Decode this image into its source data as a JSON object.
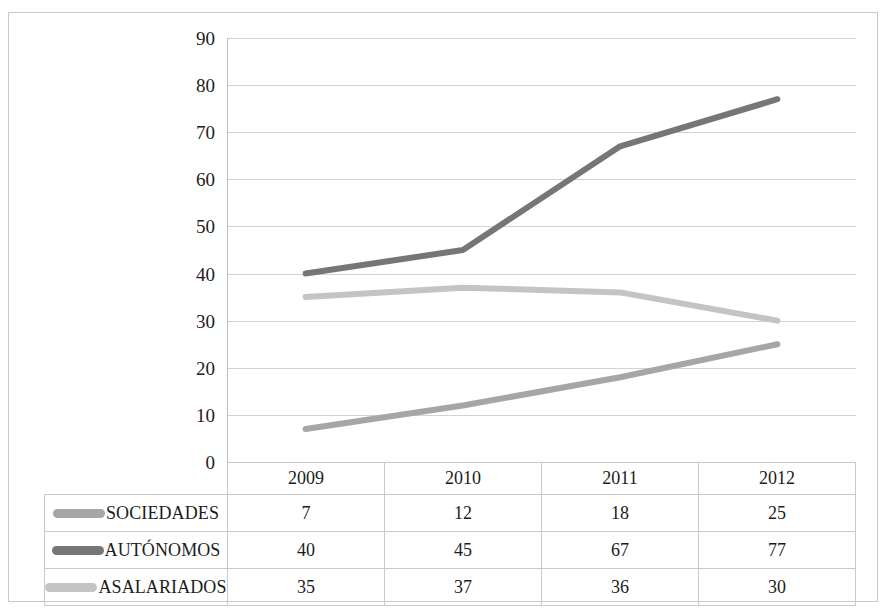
{
  "chart_data": {
    "type": "line",
    "title": "",
    "subtitle": "",
    "xlabel": "",
    "ylabel": "",
    "categories": [
      "2009",
      "2010",
      "2011",
      "2012"
    ],
    "ylim": [
      0,
      90
    ],
    "y_ticks": [
      90,
      80,
      70,
      60,
      50,
      40,
      30,
      20,
      10,
      0
    ],
    "grid": true,
    "legend_position": "data-table-left",
    "series": [
      {
        "name": "SOCIEDADES",
        "values": [
          7,
          12,
          18,
          25
        ],
        "color": "#a6a6a6"
      },
      {
        "name": "AUTÓNOMOS",
        "values": [
          40,
          45,
          67,
          77
        ],
        "color": "#767676"
      },
      {
        "name": "ASALARIADOS",
        "values": [
          35,
          37,
          36,
          30
        ],
        "color": "#c4c4c4"
      }
    ]
  },
  "table": {
    "corner_label": "",
    "header": [
      "2009",
      "2010",
      "2011",
      "2012"
    ],
    "rows": [
      {
        "label": "SOCIEDADES",
        "cells": [
          "7",
          "12",
          "18",
          "25"
        ]
      },
      {
        "label": "AUTÓNOMOS",
        "cells": [
          "40",
          "45",
          "67",
          "77"
        ]
      },
      {
        "label": "ASALARIADOS",
        "cells": [
          "35",
          "37",
          "36",
          "30"
        ]
      }
    ]
  },
  "axis": {
    "y_labels": [
      "90",
      "80",
      "70",
      "60",
      "50",
      "40",
      "30",
      "20",
      "10",
      "0"
    ]
  },
  "colors": {
    "grid": "#d2d2d2",
    "border": "#c9c9c9",
    "text": "#1c1c1c",
    "sociedades": "#a6a6a6",
    "autonomos": "#767676",
    "asalariados": "#c4c4c4"
  }
}
